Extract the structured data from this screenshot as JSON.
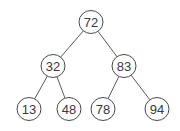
{
  "diagram": {
    "type": "binary-tree",
    "nodes": [
      {
        "id": "n72",
        "label": "72",
        "x": 91,
        "y": 22
      },
      {
        "id": "n32",
        "label": "32",
        "x": 53,
        "y": 66
      },
      {
        "id": "n83",
        "label": "83",
        "x": 124,
        "y": 66
      },
      {
        "id": "n13",
        "label": "13",
        "x": 29,
        "y": 109
      },
      {
        "id": "n48",
        "label": "48",
        "x": 69,
        "y": 109
      },
      {
        "id": "n78",
        "label": "78",
        "x": 103,
        "y": 109
      },
      {
        "id": "n94",
        "label": "94",
        "x": 157,
        "y": 109
      }
    ],
    "edges": [
      {
        "from": "n72",
        "to": "n32"
      },
      {
        "from": "n72",
        "to": "n83"
      },
      {
        "from": "n32",
        "to": "n13"
      },
      {
        "from": "n32",
        "to": "n48"
      },
      {
        "from": "n83",
        "to": "n78"
      },
      {
        "from": "n83",
        "to": "n94"
      }
    ],
    "node_radius": 11.5
  }
}
